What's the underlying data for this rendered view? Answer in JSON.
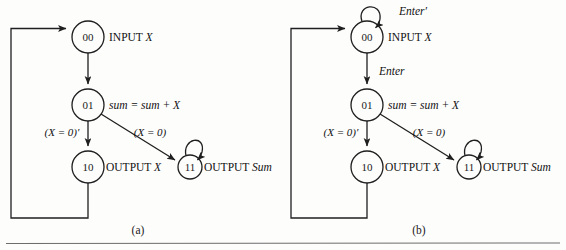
{
  "figure": {
    "background_color": "#fdfdfc",
    "stroke_color": "#1f1f1f",
    "rule_color": "#6d6d6d"
  },
  "panels": [
    {
      "id": "panel-a",
      "caption": "(a)",
      "caption_x": 138,
      "caption_y": 231,
      "nodes": [
        {
          "id": "n00",
          "label": "00",
          "cx": 88,
          "cy": 37,
          "r": 16,
          "action_prefix": "INPUT ",
          "action_italic": "X",
          "action_x": 109,
          "action_y": 37
        },
        {
          "id": "n01",
          "label": "01",
          "cx": 88,
          "cy": 105,
          "r": 16,
          "action_prefix": "",
          "action_italic": "sum = sum + X",
          "action_x": 109,
          "action_y": 105
        },
        {
          "id": "n10",
          "label": "10",
          "cx": 88,
          "cy": 167,
          "r": 16,
          "action_prefix": "OUTPUT ",
          "action_italic": "X",
          "action_x": 106,
          "action_y": 167
        },
        {
          "id": "n11",
          "label": "11",
          "cx": 190,
          "cy": 167,
          "r": 12,
          "action_prefix": "OUTPUT ",
          "action_italic": "Sum",
          "action_x": 204,
          "action_y": 167
        }
      ],
      "edge_labels": [
        {
          "id": "cond-not-x0",
          "text": "(X = 0)′",
          "x": 62,
          "y": 133
        },
        {
          "id": "cond-x0",
          "text": "(X = 0)",
          "x": 150,
          "y": 133
        }
      ],
      "transition_labels": []
    },
    {
      "id": "panel-b",
      "caption": "(b)",
      "caption_x": 419,
      "caption_y": 231,
      "nodes": [
        {
          "id": "n00",
          "label": "00",
          "cx": 367,
          "cy": 37,
          "r": 16,
          "action_prefix": "INPUT ",
          "action_italic": "X",
          "action_x": 388,
          "action_y": 37
        },
        {
          "id": "n01",
          "label": "01",
          "cx": 367,
          "cy": 105,
          "r": 16,
          "action_prefix": "",
          "action_italic": "sum = sum + X",
          "action_x": 388,
          "action_y": 105
        },
        {
          "id": "n10",
          "label": "10",
          "cx": 367,
          "cy": 167,
          "r": 16,
          "action_prefix": "OUTPUT ",
          "action_italic": "X",
          "action_x": 385,
          "action_y": 167
        },
        {
          "id": "n11",
          "label": "11",
          "cx": 469,
          "cy": 167,
          "r": 12,
          "action_prefix": "OUTPUT ",
          "action_italic": "Sum",
          "action_x": 483,
          "action_y": 167
        }
      ],
      "edge_labels": [
        {
          "id": "cond-not-x0",
          "text": "(X = 0)′",
          "x": 341,
          "y": 133
        },
        {
          "id": "cond-x0",
          "text": "(X = 0)",
          "x": 429,
          "y": 133
        }
      ],
      "transition_labels": [
        {
          "id": "enter-prime",
          "text": "Enter′",
          "x": 399,
          "y": 11
        },
        {
          "id": "enter",
          "text": "Enter",
          "x": 379,
          "y": 71
        }
      ]
    }
  ]
}
